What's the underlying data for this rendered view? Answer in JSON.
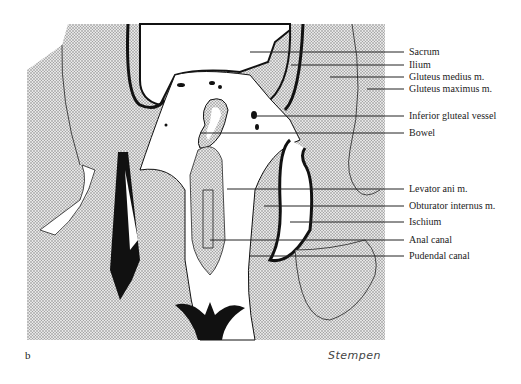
{
  "figure": {
    "panel_letter": "b",
    "signature": "Stempen",
    "colors": {
      "stipple_bg": "#d4d4d4",
      "outline": "#111111",
      "leader": "#222222",
      "text": "#222222"
    }
  },
  "labels": [
    {
      "text": "Sacrum",
      "y": 52,
      "line_from_x": 250
    },
    {
      "text": "Ilium",
      "y": 65,
      "line_from_x": 291
    },
    {
      "text": "Gluteus medius m.",
      "y": 77,
      "line_from_x": 330
    },
    {
      "text": "Gluteus maximus m.",
      "y": 89,
      "line_from_x": 367
    },
    {
      "text": "Inferior gluteal vessel",
      "y": 116,
      "line_from_x": 255
    },
    {
      "text": "Bowel",
      "y": 133,
      "line_from_x": 200
    },
    {
      "text": "Levator ani m.",
      "y": 189,
      "line_from_x": 227
    },
    {
      "text": "Obturator internus m.",
      "y": 206,
      "line_from_x": 264
    },
    {
      "text": "Ischium",
      "y": 222,
      "line_from_x": 290
    },
    {
      "text": "Anal canal",
      "y": 240,
      "line_from_x": 210
    },
    {
      "text": "Pudendal canal",
      "y": 256,
      "line_from_x": 250
    }
  ]
}
